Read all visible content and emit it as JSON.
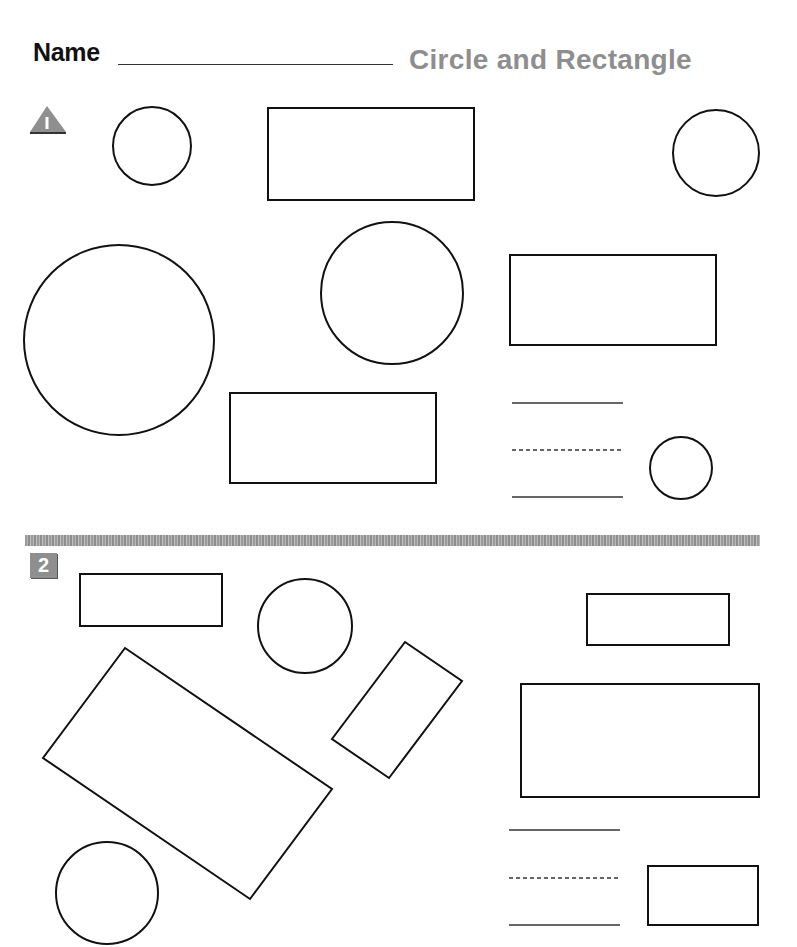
{
  "header": {
    "name_label": "Name",
    "title": "Circle and Rectangle"
  },
  "colors": {
    "title": "#8e8e8e",
    "badge": "#8f8f8f",
    "stroke": "#111111"
  },
  "sections": [
    {
      "number": "1",
      "badge_shape": "triangle",
      "shapes": [
        {
          "type": "circle",
          "cx": 152,
          "cy": 146,
          "r": 39
        },
        {
          "type": "rect",
          "x": 268,
          "y": 108,
          "w": 206,
          "h": 92
        },
        {
          "type": "circle",
          "cx": 716,
          "cy": 153,
          "r": 43
        },
        {
          "type": "circle",
          "cx": 119,
          "cy": 340,
          "r": 95
        },
        {
          "type": "circle",
          "cx": 392,
          "cy": 293,
          "r": 71
        },
        {
          "type": "rect",
          "x": 510,
          "y": 255,
          "w": 206,
          "h": 90
        },
        {
          "type": "rect",
          "x": 230,
          "y": 393,
          "w": 206,
          "h": 90
        },
        {
          "type": "circle",
          "cx": 681,
          "cy": 468,
          "r": 31
        }
      ],
      "writing_lines": {
        "x1": 512,
        "x2": 623,
        "top": 403,
        "mid": 450,
        "bottom": 497
      }
    },
    {
      "number": "2",
      "badge_shape": "square",
      "shapes": [
        {
          "type": "rect",
          "x": 80,
          "y": 574,
          "w": 142,
          "h": 52
        },
        {
          "type": "circle",
          "cx": 305,
          "cy": 626,
          "r": 47
        },
        {
          "type": "rect",
          "x": 587,
          "y": 594,
          "w": 142,
          "h": 51
        },
        {
          "type": "polygon",
          "points": "125,648 332,789 250,899 43,758"
        },
        {
          "type": "polygon",
          "points": "405,642 462,681 389,778 332,739"
        },
        {
          "type": "rect",
          "x": 521,
          "y": 684,
          "w": 238,
          "h": 113
        },
        {
          "type": "circle",
          "cx": 107,
          "cy": 893,
          "r": 51
        },
        {
          "type": "rect",
          "x": 648,
          "y": 866,
          "w": 110,
          "h": 59
        }
      ],
      "writing_lines": {
        "x1": 509,
        "x2": 620,
        "top": 830,
        "mid": 878,
        "bottom": 925
      }
    }
  ]
}
